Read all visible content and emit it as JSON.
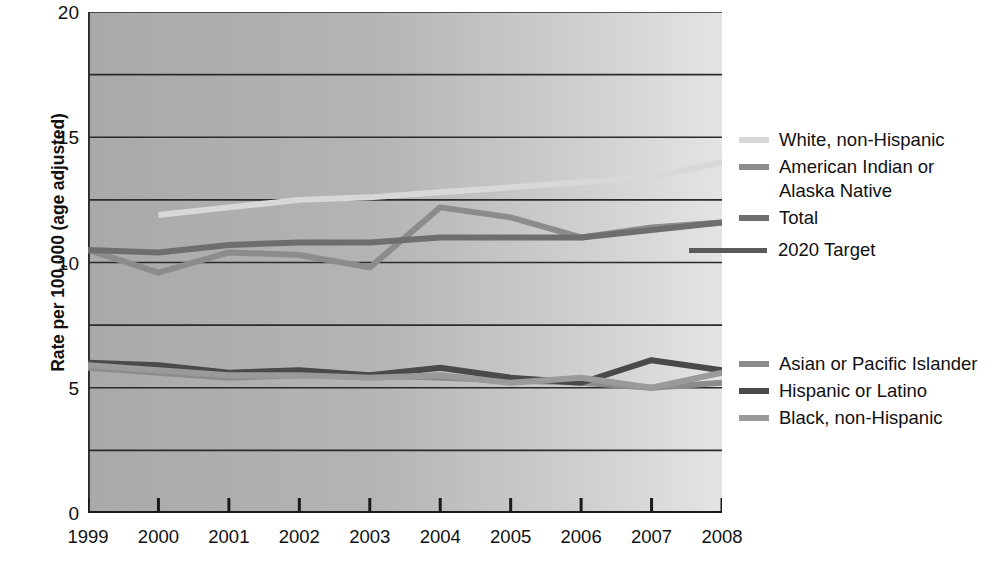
{
  "axes": {
    "ylabel": "Rate per 100,000 (age adjusted)",
    "yticks": [
      "0",
      "5",
      "10",
      "15",
      "20"
    ],
    "xticks": [
      "1999",
      "2000",
      "2001",
      "2002",
      "2003",
      "2004",
      "2005",
      "2006",
      "2007",
      "2008"
    ]
  },
  "legend": {
    "upper": [
      {
        "label": "White, non-Hispanic",
        "color": "#d8d8d8"
      },
      {
        "label": "American Indian or\nAlaska Native",
        "color": "#8c8c8c"
      },
      {
        "label": "Total",
        "color": "#6e6e6e"
      }
    ],
    "target": {
      "label": "2020 Target",
      "color": "#5a5a5a"
    },
    "lower": [
      {
        "label": "Asian or Pacific Islander",
        "color": "#8c8c8c"
      },
      {
        "label": "Hispanic or Latino",
        "color": "#4a4a4a"
      },
      {
        "label": "Black, non-Hispanic",
        "color": "#9a9a9a"
      }
    ]
  },
  "chart_data": {
    "type": "line",
    "title": "",
    "xlabel": "",
    "ylabel": "Rate per 100,000 (age adjusted)",
    "x": [
      1999,
      2000,
      2001,
      2002,
      2003,
      2004,
      2005,
      2006,
      2007,
      2008
    ],
    "xlim": [
      1999,
      2008
    ],
    "ylim": [
      0,
      20
    ],
    "yticks": [
      0,
      5,
      10,
      15,
      20
    ],
    "gridlines": [
      2.5,
      5,
      7.5,
      10,
      12.5,
      15,
      17.5,
      20
    ],
    "grid": true,
    "legend_position": "right",
    "series": [
      {
        "name": "White, non-Hispanic",
        "color": "#d8d8d8",
        "values": [
          null,
          11.9,
          12.2,
          12.5,
          12.6,
          12.8,
          13.0,
          13.2,
          13.4,
          14.0
        ]
      },
      {
        "name": "American Indian or Alaska Native",
        "color": "#8c8c8c",
        "values": [
          10.5,
          9.6,
          10.4,
          10.3,
          9.8,
          12.2,
          11.8,
          11.0,
          11.4,
          11.6
        ]
      },
      {
        "name": "Total",
        "color": "#6e6e6e",
        "values": [
          10.5,
          10.4,
          10.7,
          10.8,
          10.8,
          11.0,
          11.0,
          11.0,
          11.3,
          11.6
        ]
      },
      {
        "name": "Asian or Pacific Islander",
        "color": "#8c8c8c",
        "values": [
          5.8,
          5.6,
          5.4,
          5.5,
          5.5,
          5.4,
          5.3,
          5.2,
          5.0,
          5.2
        ]
      },
      {
        "name": "Hispanic or Latino",
        "color": "#4a4a4a",
        "values": [
          6.0,
          5.9,
          5.6,
          5.7,
          5.5,
          5.8,
          5.4,
          5.2,
          6.1,
          5.7
        ]
      },
      {
        "name": "Black, non-Hispanic",
        "color": "#9a9a9a",
        "values": [
          5.9,
          5.7,
          5.5,
          5.5,
          5.4,
          5.5,
          5.2,
          5.4,
          5.0,
          5.6
        ]
      }
    ]
  }
}
